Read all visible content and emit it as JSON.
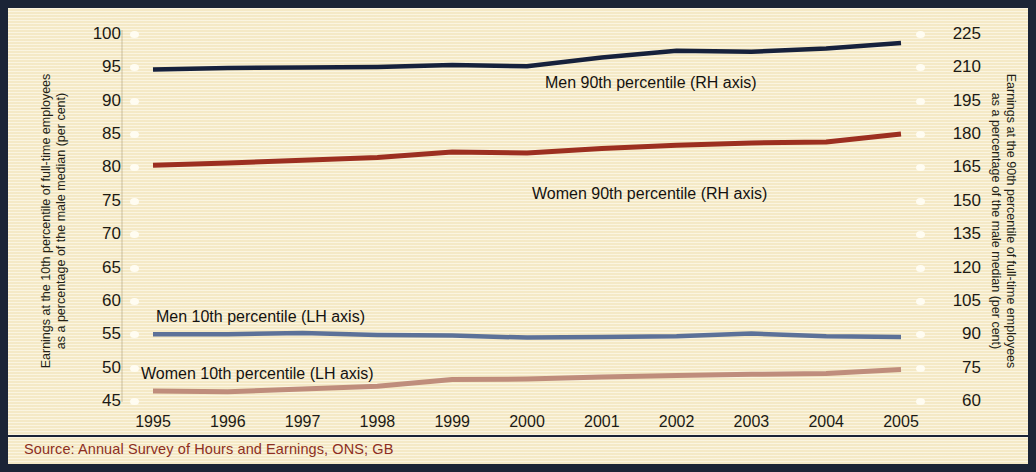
{
  "source": {
    "text": "Source: Annual Survey of Hours and Earnings, ONS; GB",
    "color": "#8d2f22"
  },
  "axes": {
    "left_title_line1": "Earnings at the 10th percentile of full-time employees",
    "left_title_line2": "as a percentage of the male median (per cent)",
    "right_title_line1": "Earnings at the 90th percentile of full-time employees",
    "right_title_line2": "as a percentage of the male median (per cent)"
  },
  "chart_data": {
    "type": "line",
    "title": "",
    "subtitle": "",
    "xlabel": "",
    "ylabel": "Earnings at the 10th percentile of full-time employees as a percentage of the male median (per cent)",
    "y2label": "Earnings at the 90th percentile of full-time employees as a percentage of the male median (per cent)",
    "x": [
      "1995",
      "1996",
      "1997",
      "1998",
      "1999",
      "2000",
      "2001",
      "2002",
      "2003",
      "2004",
      "2005"
    ],
    "categories": [
      "1995",
      "1996",
      "1997",
      "1998",
      "1999",
      "2000",
      "2001",
      "2002",
      "2003",
      "2004",
      "2005"
    ],
    "ylim": [
      45,
      100
    ],
    "yticks": [
      100,
      95,
      90,
      85,
      80,
      75,
      70,
      65,
      60,
      55,
      50,
      45
    ],
    "y2lim": [
      60,
      225
    ],
    "y2ticks": [
      225,
      210,
      195,
      180,
      165,
      150,
      135,
      120,
      105,
      90,
      75,
      60
    ],
    "grid": false,
    "legend": "inline-annotations",
    "series": [
      {
        "name": "Men 90th percentile (RH axis)",
        "axis": "right",
        "color": "#16213c",
        "values": [
          209.0,
          209.7,
          210.0,
          210.2,
          211.0,
          210.5,
          214.5,
          217.5,
          217.0,
          218.5,
          221.0
        ]
      },
      {
        "name": "Women 90th percentile (RH axis)",
        "axis": "right",
        "color": "#9c2f20",
        "values": [
          166.0,
          167.0,
          168.2,
          169.5,
          172.0,
          171.5,
          173.5,
          175.0,
          176.0,
          176.5,
          180.0
        ]
      },
      {
        "name": "Men 10th percentile (LH axis)",
        "axis": "left",
        "color": "#5c7198",
        "values": [
          55.0,
          55.0,
          55.2,
          54.9,
          54.8,
          54.5,
          54.6,
          54.7,
          55.1,
          54.7,
          54.6
        ]
      },
      {
        "name": "Women 10th percentile (LH axis)",
        "axis": "left",
        "color": "#bf8d7c",
        "values": [
          46.5,
          46.4,
          46.8,
          47.2,
          48.2,
          48.3,
          48.6,
          48.8,
          49.0,
          49.1,
          49.7
        ]
      }
    ]
  }
}
